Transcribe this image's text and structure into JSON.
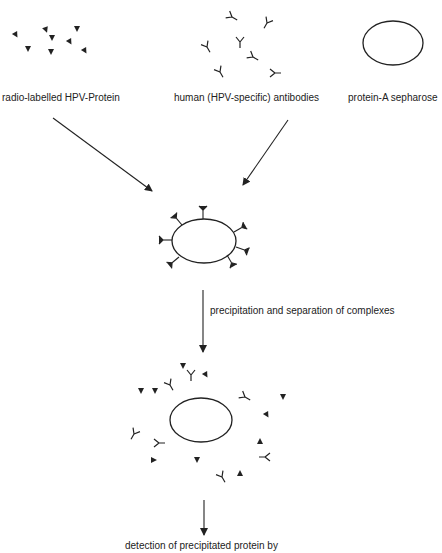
{
  "diagram": {
    "type": "process-flow",
    "title": "",
    "colors": {
      "ink": "#222222",
      "background": "#ffffff"
    },
    "inputs": [
      {
        "id": "protein",
        "label": "radio-labelled HPV-Protein",
        "icon": "triangle-marker-icon"
      },
      {
        "id": "antibodies",
        "label": "human (HPV-specific) antibodies",
        "icon": "y-antibody-icon"
      },
      {
        "id": "sepharose",
        "label": "protein-A sepharose",
        "icon": "ellipse-bead-icon"
      }
    ],
    "steps": [
      {
        "id": "complex",
        "label": "",
        "description": "sepharose bead bound by antibody–protein complexes"
      },
      {
        "id": "precipitation",
        "label": "precipitation and separation of complexes"
      },
      {
        "id": "separated",
        "label": "",
        "description": "bead with free antibodies and free proteins after separation"
      },
      {
        "id": "detection",
        "label": "detection of precipitated protein by"
      }
    ],
    "edges": [
      {
        "from": "protein",
        "to": "complex"
      },
      {
        "from": "antibodies",
        "to": "complex"
      },
      {
        "from": "complex",
        "to": "separated",
        "label": "precipitation and separation of complexes"
      },
      {
        "from": "separated",
        "to": "detection"
      }
    ]
  }
}
